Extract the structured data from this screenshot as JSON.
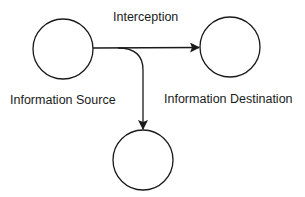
{
  "diagram": {
    "type": "flow",
    "nodes": [
      {
        "id": "source",
        "label": "Information Source"
      },
      {
        "id": "destination",
        "label": "Information Destination"
      },
      {
        "id": "interceptor",
        "label": ""
      }
    ],
    "edges": [
      {
        "from": "source",
        "to": "destination",
        "label": "Interception"
      },
      {
        "from": "source",
        "to": "interceptor",
        "label": ""
      }
    ],
    "labels": {
      "interception": "Interception",
      "source": "Information Source",
      "destination": "Information Destination"
    },
    "colors": {
      "stroke": "#1a1a1a",
      "background": "#ffffff"
    }
  }
}
